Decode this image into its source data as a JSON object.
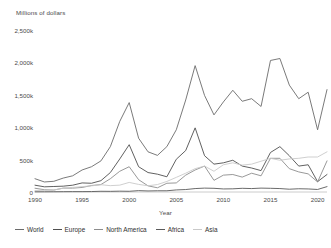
{
  "chart_data": {
    "type": "line",
    "title": "",
    "subtitle": "",
    "ylabel": "Millions of dollars",
    "xlabel": "Year",
    "yticks": [
      "0",
      "500k",
      "1,000k",
      "1,500k",
      "2,000k",
      "2,500k"
    ],
    "ytick_values": [
      0,
      500000,
      1000000,
      1500000,
      2000000,
      2500000
    ],
    "ylim": [
      0,
      2500000
    ],
    "xticks": [
      "1990",
      "1995",
      "2000",
      "2005",
      "2010",
      "2015",
      "2020"
    ],
    "xtick_values": [
      1990,
      1995,
      2000,
      2005,
      2010,
      2015,
      2020
    ],
    "xlim": [
      1990,
      2021
    ],
    "grid": false,
    "legend_position": "bottom",
    "x": [
      1990,
      1991,
      1992,
      1993,
      1994,
      1995,
      1996,
      1997,
      1998,
      1999,
      2000,
      2001,
      2002,
      2003,
      2004,
      2005,
      2006,
      2007,
      2008,
      2009,
      2010,
      2011,
      2012,
      2013,
      2014,
      2015,
      2016,
      2017,
      2018,
      2019,
      2020,
      2021
    ],
    "series": [
      {
        "name": "World",
        "color": "#6b6b6b",
        "values": [
          205000,
          155000,
          165000,
          215000,
          250000,
          340000,
          390000,
          480000,
          700000,
          1090000,
          1380000,
          830000,
          620000,
          565000,
          700000,
          960000,
          1420000,
          1950000,
          1490000,
          1190000,
          1390000,
          1570000,
          1400000,
          1440000,
          1320000,
          2030000,
          2060000,
          1650000,
          1440000,
          1540000,
          960000,
          1580000
        ]
      },
      {
        "name": "Europe",
        "color": "#4f4f4f",
        "values": [
          105000,
          80000,
          85000,
          90000,
          105000,
          140000,
          135000,
          175000,
          300000,
          510000,
          730000,
          390000,
          300000,
          275000,
          235000,
          505000,
          640000,
          990000,
          560000,
          430000,
          450000,
          490000,
          400000,
          370000,
          330000,
          610000,
          700000,
          560000,
          400000,
          420000,
          160000,
          270000
        ]
      },
      {
        "name": "North America",
        "color": "#8d8d8d",
        "values": [
          58000,
          35000,
          30000,
          60000,
          60000,
          70000,
          100000,
          115000,
          205000,
          320000,
          390000,
          190000,
          95000,
          65000,
          135000,
          140000,
          260000,
          340000,
          400000,
          180000,
          260000,
          270000,
          230000,
          290000,
          250000,
          520000,
          520000,
          360000,
          310000,
          280000,
          155000,
          480000
        ]
      },
      {
        "name": "Africa",
        "color": "#5a5a5a",
        "values": [
          3000,
          3500,
          4000,
          5000,
          6000,
          6000,
          7000,
          11000,
          10000,
          13000,
          11000,
          21000,
          16000,
          19000,
          19000,
          32000,
          38000,
          53000,
          60000,
          57000,
          47000,
          49000,
          57000,
          53000,
          60000,
          57000,
          53000,
          43000,
          50000,
          47000,
          39000,
          83000
        ]
      },
      {
        "name": "Asia",
        "color": "#c9c9c9",
        "values": [
          23000,
          26000,
          32000,
          58000,
          71000,
          83000,
          95000,
          112000,
          98000,
          106000,
          148000,
          117000,
          96000,
          115000,
          163000,
          226000,
          290000,
          360000,
          400000,
          320000,
          420000,
          450000,
          415000,
          430000,
          475000,
          520000,
          490000,
          510000,
          520000,
          540000,
          540000,
          620000
        ]
      }
    ]
  }
}
